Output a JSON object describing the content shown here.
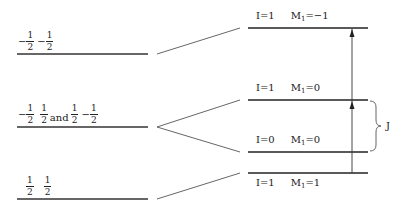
{
  "left_levels": [
    {
      "id": "upper",
      "label_parts": [
        {
          "sign": "−",
          "num": "1",
          "den": "2"
        },
        {
          "sign": "−",
          "num": "1",
          "den": "2"
        }
      ]
    },
    {
      "id": "middle",
      "label_parts": [
        {
          "sign": "−",
          "num": "1",
          "den": "2"
        },
        {
          "sign": "",
          "num": "1",
          "den": "2"
        },
        {
          "word": "and"
        },
        {
          "sign": "",
          "num": "1",
          "den": "2"
        },
        {
          "sign": "−",
          "num": "1",
          "den": "2"
        }
      ]
    },
    {
      "id": "lower",
      "label_parts": [
        {
          "sign": "",
          "num": "1",
          "den": "2"
        },
        {
          "sign": "",
          "num": "1",
          "den": "2"
        }
      ]
    }
  ],
  "right_levels": [
    {
      "id": "r1",
      "I": "I=1",
      "M": "M",
      "M_sub": "1",
      "M_val": "=−1",
      "label_position": "above"
    },
    {
      "id": "r2",
      "I": "I=1",
      "M": "M",
      "M_sub": "1",
      "M_val": "=0",
      "label_position": "above"
    },
    {
      "id": "r3",
      "I": "I=0",
      "M": "M",
      "M_sub": "1",
      "M_val": "=0",
      "label_position": "above"
    },
    {
      "id": "r4",
      "I": "I=1",
      "M": "M",
      "M_sub": "1",
      "M_val": "=1",
      "label_position": "below"
    }
  ],
  "brace_label": "J",
  "arrows": [
    {
      "from": "r4",
      "to": "r2"
    },
    {
      "from": "r2",
      "to": "r1"
    }
  ]
}
